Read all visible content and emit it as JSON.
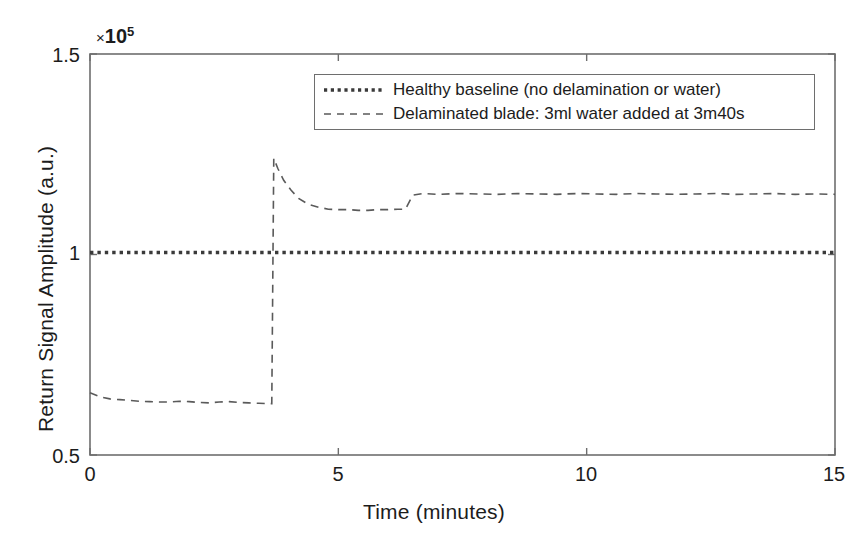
{
  "chart_data": {
    "type": "line",
    "title": "",
    "subtitle": "",
    "xlabel": "Time (minutes)",
    "ylabel": "Return Signal Amplitude (a.u.)",
    "y_exponent_label": "×10⁵",
    "y_exponent_mul": "×",
    "y_exponent_base": "10",
    "y_exponent_power": "5",
    "xlim": [
      0,
      15
    ],
    "ylim": [
      0.5,
      1.5
    ],
    "xticks": [
      0,
      5,
      10,
      15
    ],
    "xtick_labels": [
      "0",
      "5",
      "10",
      "15"
    ],
    "yticks": [
      0.5,
      1,
      1.5
    ],
    "ytick_labels": [
      "0.5",
      "1",
      "1.5"
    ],
    "grid": false,
    "legend_position": "top-right-inside",
    "event_time_minutes": 3.67,
    "event_label": "3m40s",
    "series": [
      {
        "name": "Healthy baseline (no delamination or water)",
        "style": "dotted",
        "color": "#3a3a3a",
        "x": [
          0,
          1,
          2,
          3,
          4,
          5,
          6,
          7,
          8,
          9,
          10,
          11,
          12,
          13,
          14,
          15
        ],
        "values": [
          1.005,
          1.005,
          1.005,
          1.005,
          1.005,
          1.005,
          1.005,
          1.005,
          1.005,
          1.005,
          1.005,
          1.005,
          1.005,
          1.005,
          1.005,
          1.005
        ]
      },
      {
        "name": "Delaminated blade: 3ml water added at 3m40s",
        "style": "dashed",
        "color": "#5a5a5a",
        "x": [
          0.0,
          0.2,
          0.4,
          0.6,
          0.8,
          1.0,
          1.2,
          1.4,
          1.6,
          1.8,
          2.0,
          2.2,
          2.4,
          2.6,
          2.8,
          3.0,
          3.2,
          3.4,
          3.6,
          3.66,
          3.7,
          3.78,
          3.9,
          4.05,
          4.2,
          4.4,
          4.6,
          4.8,
          5.0,
          5.2,
          5.4,
          5.6,
          5.8,
          6.0,
          6.2,
          6.35,
          6.5,
          6.7,
          7.0,
          7.4,
          7.8,
          8.2,
          8.6,
          9.0,
          9.4,
          9.8,
          10.2,
          10.6,
          11.0,
          11.4,
          11.8,
          12.2,
          12.6,
          13.0,
          13.4,
          13.8,
          14.2,
          14.6,
          15.0
        ],
        "values": [
          0.655,
          0.645,
          0.64,
          0.638,
          0.636,
          0.634,
          0.633,
          0.632,
          0.632,
          0.634,
          0.633,
          0.631,
          0.63,
          0.632,
          0.633,
          0.631,
          0.63,
          0.629,
          0.628,
          0.628,
          1.24,
          1.215,
          1.185,
          1.16,
          1.14,
          1.125,
          1.118,
          1.113,
          1.112,
          1.112,
          1.11,
          1.11,
          1.112,
          1.112,
          1.113,
          1.113,
          1.148,
          1.152,
          1.15,
          1.152,
          1.151,
          1.15,
          1.152,
          1.151,
          1.15,
          1.152,
          1.151,
          1.15,
          1.152,
          1.151,
          1.15,
          1.151,
          1.152,
          1.15,
          1.151,
          1.152,
          1.15,
          1.151,
          1.15
        ]
      }
    ]
  },
  "legend": {
    "entries": [
      {
        "label": "Healthy baseline (no delamination or water)",
        "style": "dotted"
      },
      {
        "label": "Delaminated blade: 3ml water added at 3m40s",
        "style": "dashed"
      }
    ]
  },
  "colors": {
    "background": "#ffffff",
    "axis": "#6e6e6e",
    "text": "#1c1c1c",
    "baseline_series": "#3a3a3a",
    "delaminated_series": "#5a5a5a"
  }
}
